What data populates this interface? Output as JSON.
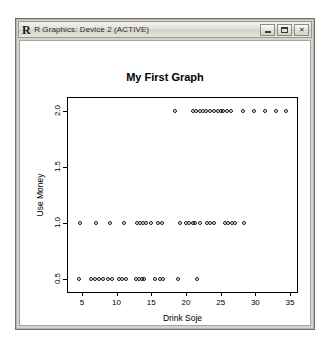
{
  "window": {
    "title": "R Graphics: Device 2 (ACTIVE)",
    "logo": "R",
    "buttons": {
      "minimize": "minimize-button",
      "maximize": "maximize-button",
      "close": "✕"
    }
  },
  "chart_data": {
    "type": "scatter",
    "title": "My First Graph",
    "xlabel": "Drink Soje",
    "ylabel": "Use Money",
    "xlim": [
      3.0,
      36.0
    ],
    "ylim": [
      0.38,
      2.12
    ],
    "xticks": [
      5,
      10,
      15,
      20,
      25,
      30,
      35
    ],
    "yticks": [
      0.5,
      1.0,
      1.5,
      2.0
    ],
    "xtick_labels": [
      "5",
      "10",
      "15",
      "20",
      "25",
      "30",
      "35"
    ],
    "ytick_labels": [
      "0.5",
      "1.0",
      "1.5",
      "2.0"
    ],
    "grid": false,
    "legend": false,
    "marker": "open-circle",
    "marker_color": "#1a1a1a",
    "series": [
      {
        "name": "observations",
        "x": [
          4.6,
          6.3,
          6.9,
          7.5,
          8.1,
          8.7,
          9.4,
          10.3,
          10.8,
          11.3,
          12.8,
          13.2,
          13.6,
          14.0,
          15.6,
          16.2,
          16.7,
          18.9,
          21.6,
          4.8,
          7.1,
          9.0,
          11.0,
          13.0,
          13.4,
          13.8,
          14.3,
          15.0,
          15.9,
          16.5,
          19.2,
          20.0,
          20.5,
          21.0,
          21.3,
          22.0,
          23.0,
          23.4,
          24.0,
          25.6,
          26.1,
          26.6,
          27.1,
          28.3,
          18.4,
          21.0,
          21.5,
          22.0,
          22.4,
          22.9,
          23.5,
          24.1,
          24.6,
          25.0,
          25.4,
          25.9,
          26.5,
          28.2,
          29.8,
          31.4,
          33.0,
          34.4
        ],
        "y": [
          0.5,
          0.5,
          0.5,
          0.5,
          0.5,
          0.5,
          0.5,
          0.5,
          0.5,
          0.5,
          0.5,
          0.5,
          0.5,
          0.5,
          0.5,
          0.5,
          0.5,
          0.5,
          0.5,
          1.0,
          1.0,
          1.0,
          1.0,
          1.0,
          1.0,
          1.0,
          1.0,
          1.0,
          1.0,
          1.0,
          1.0,
          1.0,
          1.0,
          1.0,
          1.0,
          1.0,
          1.0,
          1.0,
          1.0,
          1.0,
          1.0,
          1.0,
          1.0,
          1.0,
          2.0,
          2.0,
          2.0,
          2.0,
          2.0,
          2.0,
          2.0,
          2.0,
          2.0,
          2.0,
          2.0,
          2.0,
          2.0,
          2.0,
          2.0,
          2.0,
          2.0,
          2.0
        ]
      }
    ]
  }
}
